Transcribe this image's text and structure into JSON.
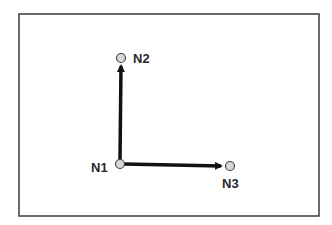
{
  "diagram": {
    "frame": {
      "x1": 19,
      "y1": 14,
      "x2": 319,
      "y2": 216,
      "stroke": "#3a3a3a"
    },
    "colors": {
      "edge": "#111111",
      "node_fill": "#d8d8d8",
      "node_stroke": "#444444",
      "label": "#2a2a2a"
    },
    "nodes": [
      {
        "id": "N1",
        "label": "N1",
        "cx": 120,
        "cy": 164,
        "label_x": 91,
        "label_y": 172
      },
      {
        "id": "N2",
        "label": "N2",
        "cx": 121,
        "cy": 58,
        "label_x": 133,
        "label_y": 63
      },
      {
        "id": "N3",
        "label": "N3",
        "cx": 230,
        "cy": 166,
        "label_x": 222,
        "label_y": 188
      }
    ],
    "edges": [
      {
        "from": "N1",
        "to": "N2",
        "directed": true
      },
      {
        "from": "N1",
        "to": "N3",
        "directed": true
      }
    ]
  }
}
